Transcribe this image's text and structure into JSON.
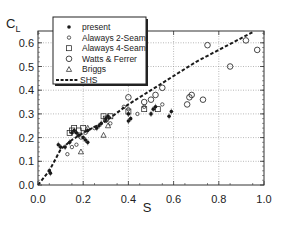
{
  "chart_data": {
    "type": "scatter",
    "title": "",
    "xlabel": "S",
    "ylabel": "C_L",
    "ylabel_main": "C",
    "ylabel_sub": "L",
    "xlim": [
      0.0,
      1.0
    ],
    "ylim": [
      0.0,
      0.65
    ],
    "grid": true,
    "legend_position": "upper-left",
    "x_ticks": [
      "0.0",
      "0.2",
      "0.4",
      "0.6",
      "0.8",
      "1.0"
    ],
    "y_ticks": [
      "0.0",
      "0.1",
      "0.2",
      "0.3",
      "0.4",
      "0.5",
      "0.6"
    ],
    "series": [
      {
        "name": "present",
        "marker": "filled-circle",
        "points": [
          [
            0.05,
            0.06
          ],
          [
            0.055,
            0.05
          ],
          [
            0.09,
            0.17
          ],
          [
            0.1,
            0.16
          ],
          [
            0.12,
            0.16
          ],
          [
            0.14,
            0.18
          ],
          [
            0.15,
            0.22
          ],
          [
            0.16,
            0.23
          ],
          [
            0.17,
            0.22
          ],
          [
            0.18,
            0.21
          ],
          [
            0.2,
            0.2
          ],
          [
            0.21,
            0.19
          ],
          [
            0.22,
            0.18
          ],
          [
            0.22,
            0.23
          ],
          [
            0.26,
            0.24
          ],
          [
            0.27,
            0.25
          ],
          [
            0.28,
            0.26
          ],
          [
            0.3,
            0.28
          ],
          [
            0.31,
            0.29
          ],
          [
            0.4,
            0.3
          ],
          [
            0.4,
            0.27
          ],
          [
            0.41,
            0.28
          ],
          [
            0.5,
            0.3
          ],
          [
            0.51,
            0.32
          ],
          [
            0.52,
            0.33
          ],
          [
            0.58,
            0.29
          ],
          [
            0.59,
            0.31
          ]
        ]
      },
      {
        "name": "Alaways 2-Seam",
        "marker": "small-open-circle",
        "points": [
          [
            0.13,
            0.13
          ],
          [
            0.15,
            0.16
          ],
          [
            0.17,
            0.17
          ],
          [
            0.19,
            0.2
          ],
          [
            0.21,
            0.22
          ],
          [
            0.25,
            0.24
          ],
          [
            0.3,
            0.27
          ],
          [
            0.32,
            0.26
          ],
          [
            0.38,
            0.33
          ],
          [
            0.4,
            0.32
          ],
          [
            0.44,
            0.3
          ],
          [
            0.47,
            0.33
          ],
          [
            0.55,
            0.34
          ]
        ]
      },
      {
        "name": "Alaways 4-Seam",
        "marker": "open-square",
        "points": [
          [
            0.14,
            0.22
          ],
          [
            0.15,
            0.23
          ],
          [
            0.16,
            0.24
          ],
          [
            0.18,
            0.23
          ],
          [
            0.2,
            0.24
          ],
          [
            0.29,
            0.29
          ],
          [
            0.3,
            0.28
          ],
          [
            0.32,
            0.29
          ],
          [
            0.4,
            0.31
          ],
          [
            0.47,
            0.32
          ],
          [
            0.53,
            0.32
          ]
        ]
      },
      {
        "name": "Watts & Ferrer",
        "marker": "large-open-circle",
        "points": [
          [
            0.4,
            0.37
          ],
          [
            0.47,
            0.35
          ],
          [
            0.5,
            0.36
          ],
          [
            0.52,
            0.38
          ],
          [
            0.55,
            0.41
          ],
          [
            0.66,
            0.34
          ],
          [
            0.67,
            0.37
          ],
          [
            0.68,
            0.38
          ],
          [
            0.73,
            0.36
          ],
          [
            0.75,
            0.59
          ],
          [
            0.85,
            0.5
          ],
          [
            0.92,
            0.61
          ],
          [
            0.97,
            0.57
          ]
        ]
      },
      {
        "name": "Briggs",
        "marker": "open-triangle",
        "points": [
          [
            0.19,
            0.14
          ],
          [
            0.22,
            0.24
          ],
          [
            0.29,
            0.21
          ],
          [
            0.31,
            0.25
          ]
        ]
      },
      {
        "name": "SHS",
        "marker": "dashed-line",
        "points": [
          [
            0.0,
            0.0
          ],
          [
            0.05,
            0.06
          ],
          [
            0.1,
            0.15
          ],
          [
            0.15,
            0.19
          ],
          [
            0.2,
            0.22
          ],
          [
            0.3,
            0.27
          ],
          [
            0.4,
            0.34
          ],
          [
            0.5,
            0.4
          ],
          [
            0.6,
            0.46
          ],
          [
            0.7,
            0.52
          ],
          [
            0.8,
            0.57
          ],
          [
            0.9,
            0.62
          ],
          [
            0.95,
            0.645
          ]
        ]
      }
    ]
  },
  "legend": {
    "items": [
      {
        "label": "present",
        "marker": "filled-circle"
      },
      {
        "label": "Alaways 2-Seam",
        "marker": "small-open-circle"
      },
      {
        "label": "Alaways 4-Seam",
        "marker": "open-square"
      },
      {
        "label": "Watts & Ferrer",
        "marker": "large-open-circle"
      },
      {
        "label": "Briggs",
        "marker": "open-triangle"
      },
      {
        "label": "SHS",
        "marker": "dashed-line"
      }
    ]
  },
  "colors": {
    "ink": "#1a1a1a",
    "grid": "#8a8a8a",
    "background": "#ffffff"
  }
}
